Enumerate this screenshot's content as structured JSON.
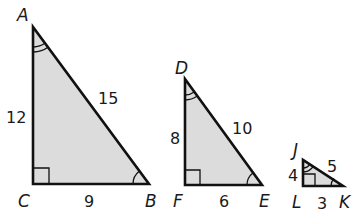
{
  "triangles": [
    {
      "name": "ABC",
      "vertices": {
        "top": "A",
        "right_angle": "C",
        "acute": "B"
      },
      "sides": {
        "vertical": "12",
        "horizontal": "9",
        "hypotenuse": "15"
      },
      "right_angle_at": "C",
      "double_arc_at": "A",
      "single_arc_at": "B"
    },
    {
      "name": "DEF",
      "vertices": {
        "top": "D",
        "right_angle": "F",
        "acute": "E"
      },
      "sides": {
        "vertical": "8",
        "horizontal": "6",
        "hypotenuse": "10"
      },
      "right_angle_at": "F",
      "double_arc_at": "D",
      "single_arc_at": "E"
    },
    {
      "name": "JKL",
      "vertices": {
        "top": "J",
        "right_angle": "L",
        "acute": "K"
      },
      "sides": {
        "vertical": "4",
        "horizontal": "3",
        "hypotenuse": "5"
      },
      "right_angle_at": "L",
      "double_arc_at": "J",
      "single_arc_at": "K"
    }
  ],
  "colors": {
    "fill": "#dcdcdc",
    "stroke": "#111111"
  }
}
